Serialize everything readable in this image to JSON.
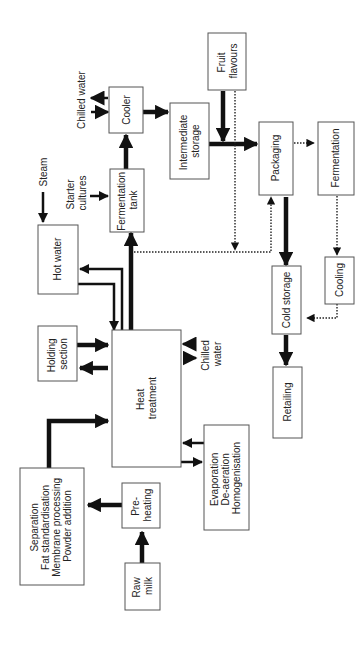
{
  "diagram": {
    "title": "",
    "orientation": "rotated 90 degrees counter-clockwise",
    "nodes": [
      {
        "id": "raw_milk",
        "lines": [
          "Raw",
          "milk"
        ]
      },
      {
        "id": "preheating",
        "lines": [
          "Pre-",
          "heating"
        ]
      },
      {
        "id": "separation",
        "lines": [
          "Separation",
          "Fat standardisation",
          "Membrane processing",
          "Powder addition"
        ]
      },
      {
        "id": "heat_treatment",
        "lines": [
          "Heat",
          "treatment"
        ]
      },
      {
        "id": "evaporation",
        "lines": [
          "Evaporation",
          "De-aeration",
          "Homogenisation"
        ]
      },
      {
        "id": "holding",
        "lines": [
          "Holding",
          "section"
        ]
      },
      {
        "id": "hot_water",
        "lines": [
          "Hot water"
        ]
      },
      {
        "id": "fermentation_tank",
        "lines": [
          "Fermentation",
          "tank"
        ]
      },
      {
        "id": "cooler",
        "lines": [
          "Cooler"
        ]
      },
      {
        "id": "intermediate_storage",
        "lines": [
          "Intermediate",
          "storage"
        ]
      },
      {
        "id": "fruit_flavours",
        "lines": [
          "Fruit",
          "flavours"
        ]
      },
      {
        "id": "packaging",
        "lines": [
          "Packaging"
        ]
      },
      {
        "id": "fermentation",
        "lines": [
          "Fermentation"
        ]
      },
      {
        "id": "cooling",
        "lines": [
          "Cooling"
        ]
      },
      {
        "id": "cold_storage",
        "lines": [
          "Cold storage"
        ]
      },
      {
        "id": "retailing",
        "lines": [
          "Retailing"
        ]
      }
    ],
    "labels": {
      "steam": "Steam",
      "starter_cultures": [
        "Starter",
        "cultures"
      ],
      "chilled_water_top": "Chilled water",
      "chilled_water_mid": [
        "Chilled",
        "water"
      ]
    },
    "edges": [
      {
        "from": "raw_milk",
        "to": "preheating",
        "style": "thick"
      },
      {
        "from": "preheating",
        "to": "separation",
        "style": "thick"
      },
      {
        "from": "separation",
        "to": "heat_treatment",
        "style": "thick"
      },
      {
        "from": "heat_treatment",
        "to": "evaporation",
        "style": "thick"
      },
      {
        "from": "evaporation",
        "to": "heat_treatment",
        "style": "thick"
      },
      {
        "from": "heat_treatment",
        "to": "holding",
        "style": "thick"
      },
      {
        "from": "holding",
        "to": "heat_treatment",
        "style": "thick"
      },
      {
        "from": "heat_treatment",
        "to": "hot_water",
        "style": "medium"
      },
      {
        "from": "hot_water",
        "to": "heat_treatment",
        "style": "medium"
      },
      {
        "from": "steam",
        "to": "hot_water",
        "style": "medium"
      },
      {
        "from": "heat_treatment",
        "to": "fermentation_tank",
        "style": "thick"
      },
      {
        "from": "starter_cultures",
        "to": "fermentation_tank",
        "style": "medium"
      },
      {
        "from": "fermentation_tank",
        "to": "cooler",
        "style": "thick"
      },
      {
        "from": "cooler",
        "to": "intermediate_storage",
        "style": "thick"
      },
      {
        "from": "intermediate_storage",
        "to": "packaging",
        "style": "thick"
      },
      {
        "from": "fruit_flavours",
        "to": "packaging",
        "style": "thick"
      },
      {
        "from": "heat_treatment",
        "to": "packaging",
        "style": "dotted"
      },
      {
        "from": "fruit_flavours",
        "to": "heat_treatment_line",
        "style": "dotted"
      },
      {
        "from": "packaging",
        "to": "fermentation",
        "style": "dotted"
      },
      {
        "from": "fermentation",
        "to": "cooling",
        "style": "dotted"
      },
      {
        "from": "cooling",
        "to": "cold_storage",
        "style": "dotted"
      },
      {
        "from": "packaging",
        "to": "cold_storage",
        "style": "thick"
      },
      {
        "from": "cold_storage",
        "to": "retailing",
        "style": "thick"
      }
    ]
  }
}
